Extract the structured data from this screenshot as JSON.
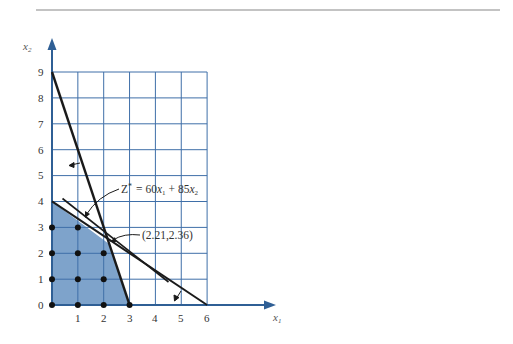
{
  "figure": {
    "top_rule": true,
    "axes": {
      "x_label": "x",
      "x_label_sub": "1",
      "y_label": "x",
      "y_label_sub": "2",
      "x_ticks": [
        "0",
        "1",
        "2",
        "3",
        "4",
        "5",
        "6"
      ],
      "y_ticks": [
        "0",
        "1",
        "2",
        "3",
        "4",
        "5",
        "6",
        "7",
        "8",
        "9"
      ],
      "x_range": [
        0,
        6
      ],
      "y_range": [
        0,
        9
      ],
      "grid": true
    },
    "annotations": {
      "objective": {
        "z": "Z",
        "star": "*",
        "eq": "= 60",
        "x1": "x",
        "x1_sub": "1",
        "plus": "+ 85",
        "x2": "x",
        "x2_sub": "2"
      },
      "optimum": "(2.21,2.36)"
    },
    "constraints": [
      {
        "name": "constraint-1",
        "from": [
          0,
          9
        ],
        "to": [
          3,
          0
        ]
      },
      {
        "name": "constraint-2",
        "from": [
          0,
          4
        ],
        "to": [
          6,
          0
        ]
      }
    ],
    "objective_line": {
      "from": [
        0.4,
        4.1
      ],
      "to": [
        4.5,
        0.9
      ]
    },
    "feasible_region": [
      [
        0,
        0
      ],
      [
        0,
        4
      ],
      [
        2.21,
        2.36
      ],
      [
        3,
        0
      ]
    ],
    "integer_points": [
      [
        0,
        0
      ],
      [
        1,
        0
      ],
      [
        2,
        0
      ],
      [
        3,
        0
      ],
      [
        0,
        1
      ],
      [
        1,
        1
      ],
      [
        2,
        1
      ],
      [
        0,
        2
      ],
      [
        1,
        2
      ],
      [
        2,
        2
      ],
      [
        0,
        3
      ],
      [
        1,
        3
      ]
    ],
    "colors": {
      "grid": "#3f6fa8",
      "axis": "#2f5f95",
      "region": "#7ea3cb",
      "lines": "#1a1a1a"
    }
  }
}
